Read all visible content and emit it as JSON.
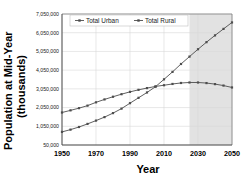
{
  "chart_data": {
    "type": "line",
    "title": "",
    "xlabel": "Year",
    "ylabel": "Population at Mid-Year (thousands)",
    "xlim": [
      1950,
      2050
    ],
    "ylim": [
      50000,
      7050000
    ],
    "xticks": [
      "1950",
      "1970",
      "1990",
      "2010",
      "2030",
      "2050"
    ],
    "xtick_values": [
      1950,
      1970,
      1990,
      2010,
      2030,
      2050
    ],
    "yticks": [
      "50,000",
      "1,050,000",
      "2,050,000",
      "3,050,000",
      "4,050,000",
      "5,050,000",
      "6,050,000",
      "7,050,000"
    ],
    "ytick_values": [
      50000,
      1050000,
      2050000,
      3050000,
      4050000,
      5050000,
      6050000,
      7050000
    ],
    "grid": true,
    "legend_position": "top-center",
    "marker": "square",
    "projection_start": 2025,
    "x": [
      1950,
      1955,
      1960,
      1965,
      1970,
      1975,
      1980,
      1985,
      1990,
      1995,
      2000,
      2005,
      2010,
      2015,
      2020,
      2025,
      2030,
      2035,
      2040,
      2045,
      2050
    ],
    "series": [
      {
        "name": "Total Urban",
        "color": "#4d4d4d",
        "values": [
          751000,
          871000,
          1012000,
          1177000,
          1354000,
          1540000,
          1754000,
          1994000,
          2285000,
          2571000,
          2857000,
          3165000,
          3559000,
          3957000,
          4379000,
          4774000,
          5167000,
          5545000,
          5907000,
          6254000,
          6599000
        ]
      },
      {
        "name": "Total Rural",
        "color": "#4d4d4d",
        "values": [
          1786000,
          1901000,
          2019000,
          2153000,
          2330000,
          2485000,
          2629000,
          2765000,
          2890000,
          2998000,
          3091000,
          3180000,
          3243000,
          3312000,
          3364000,
          3390000,
          3390000,
          3359000,
          3303000,
          3226000,
          3124000
        ]
      }
    ]
  },
  "legend": {
    "items": [
      {
        "label": "Total Urban"
      },
      {
        "label": "Total Rural"
      }
    ]
  },
  "axes": {
    "x_title": "Year",
    "y_title_line1": "Population at Mid-Year",
    "y_title_line2": "(thousands)"
  }
}
